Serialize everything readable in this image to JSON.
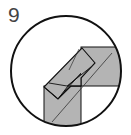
{
  "diagram": {
    "type": "origami-instruction-step",
    "step_number": "9",
    "colors": {
      "paper": "#b4b4b4",
      "outline": "#111111",
      "crease": "#333333",
      "background": "#ffffff"
    }
  }
}
